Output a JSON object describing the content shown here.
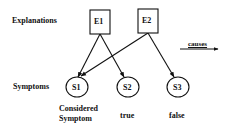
{
  "diagram": {
    "row_labels": {
      "explanations": "Explanations",
      "symptoms": "Symptoms"
    },
    "explanations": [
      {
        "id": "E1",
        "label": "E1"
      },
      {
        "id": "E2",
        "label": "E2"
      }
    ],
    "symptoms": [
      {
        "id": "S1",
        "label": "S1",
        "annotation_line1": "Considered",
        "annotation_line2": "Symptom"
      },
      {
        "id": "S2",
        "label": "S2",
        "annotation_line1": "true"
      },
      {
        "id": "S3",
        "label": "S3",
        "annotation_line1": "false"
      }
    ],
    "edges": [
      {
        "from": "E1",
        "to": "S1"
      },
      {
        "from": "E1",
        "to": "S2"
      },
      {
        "from": "E2",
        "to": "S1"
      },
      {
        "from": "E2",
        "to": "S3"
      }
    ],
    "legend": {
      "label": "causes",
      "icon": "arrow-right-icon"
    },
    "colors": {
      "stroke": "#111111",
      "background": "#ffffff"
    }
  }
}
